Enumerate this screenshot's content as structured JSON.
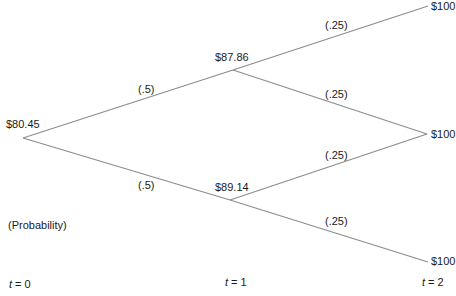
{
  "nodes": {
    "root": {
      "label": "$80.45"
    },
    "up": {
      "label": "$87.86"
    },
    "down": {
      "label": "$89.14"
    },
    "uu": {
      "label": "$100"
    },
    "mid": {
      "label": "$100"
    },
    "dd": {
      "label": "$100"
    }
  },
  "probabilities": {
    "root_up": "(.5)",
    "root_down": "(.5)",
    "up_up": "(.25)",
    "up_down": "(.25)",
    "down_up": "(.25)",
    "down_down": "(.25)"
  },
  "legend": {
    "probability_note": "(Probability)"
  },
  "time_axis": {
    "var": "t",
    "t0": " = 0",
    "t1": " = 1",
    "t2": " = 2"
  },
  "colors": {
    "line": "#8c8c8c",
    "text": "#1a1a1a"
  }
}
